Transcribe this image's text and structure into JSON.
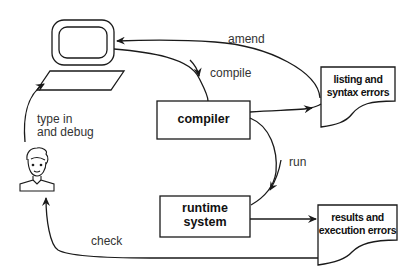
{
  "diagram": {
    "nodes": {
      "computer": {
        "label": ""
      },
      "user": {
        "label": ""
      },
      "compiler": {
        "label": "compiler"
      },
      "runtime": {
        "line1": "runtime",
        "line2": "system"
      },
      "listing": {
        "line1": "listing and",
        "line2": "syntax errors"
      },
      "results": {
        "line1": "results and",
        "line2": "execution errors"
      }
    },
    "edges": {
      "amend": "amend",
      "compile": "compile",
      "type_in": {
        "line1": "type in",
        "line2": "and debug"
      },
      "run": "run",
      "check": "check"
    },
    "colors": {
      "stroke": "#1a1a1a",
      "background": "#ffffff"
    }
  }
}
